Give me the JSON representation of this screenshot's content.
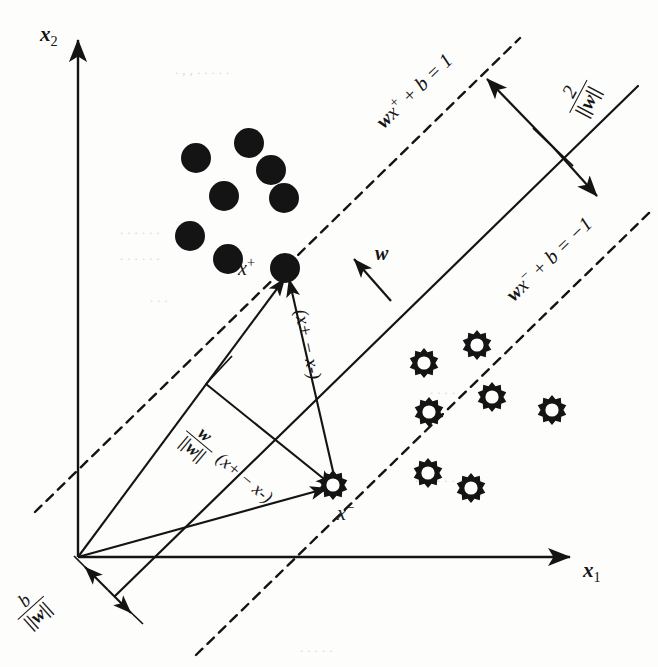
{
  "figure": {
    "axes": {
      "x_label": "x_1",
      "x_label_base": "x",
      "x_label_sub": "1",
      "y_label_base": "x",
      "y_label_sub": "2"
    },
    "labels": {
      "upper_boundary": "wx+ + b = 1",
      "upper_boundary_parts": {
        "w": "w",
        "x": "x",
        "sup": "+",
        "rest": " + b = 1"
      },
      "lower_boundary": "wx- + b = -1",
      "lower_boundary_parts": {
        "w": "w",
        "x": "x",
        "sup": "−",
        "rest": " + b = −1"
      },
      "margin_width_num": "2",
      "margin_width_den": "||w||",
      "normal_vector": "w",
      "support_positive": "x+",
      "support_positive_base": "x",
      "support_positive_sup": "+",
      "support_negative": "x-",
      "support_negative_base": "x",
      "support_negative_sup": "−",
      "bias_num": "b",
      "bias_den": "||w||",
      "difference_vector": "(x+ − x-)",
      "projection_num": "w",
      "projection_den": "||w||",
      "projection_expr": "(x+ − x-)"
    },
    "colors": {
      "ink": "#141414",
      "paper": "#fdfdfc",
      "ghost_text": "#d8d8d4"
    },
    "classes": {
      "positive_name": "positive-class-filled-circle",
      "negative_name": "negative-class-cog-ring"
    }
  },
  "chart_data": {
    "type": "scatter",
    "xlabel": "x_1",
    "ylabel": "x_2",
    "xlim": [
      0,
      658
    ],
    "ylim": [
      667,
      0
    ],
    "grid": false,
    "legend": "none",
    "series": [
      {
        "name": "positive class",
        "marker": "filled-circle",
        "radius": 15,
        "points": [
          [
            196,
            158
          ],
          [
            249,
            143
          ],
          [
            271,
            170
          ],
          [
            224,
            196
          ],
          [
            284,
            198
          ],
          [
            190,
            236
          ],
          [
            228,
            259
          ],
          [
            285,
            268
          ]
        ],
        "support_vector_index": 7
      },
      {
        "name": "negative class",
        "marker": "cog-ring",
        "radius": 15,
        "points": [
          [
            424,
            363
          ],
          [
            477,
            345
          ],
          [
            492,
            397
          ],
          [
            429,
            412
          ],
          [
            552,
            410
          ],
          [
            428,
            473
          ],
          [
            471,
            488
          ],
          [
            333,
            485
          ]
        ],
        "support_vector_index": 7
      }
    ],
    "lines": [
      {
        "name": "upper-margin-boundary",
        "label": "wx+ + b = 1",
        "style": "dashed",
        "from": [
          35,
          512
        ],
        "to": [
          520,
          38
        ]
      },
      {
        "name": "separating-hyperplane",
        "label": "",
        "style": "solid",
        "from": [
          115,
          596
        ],
        "to": [
          638,
          86
        ]
      },
      {
        "name": "lower-margin-boundary",
        "label": "wx- + b = -1",
        "style": "dashed",
        "from": [
          196,
          655
        ],
        "to": [
          652,
          210
        ]
      }
    ],
    "vectors": [
      {
        "name": "x-axis",
        "from": [
          78,
          557
        ],
        "to": [
          575,
          557
        ]
      },
      {
        "name": "y-axis",
        "from": [
          78,
          557
        ],
        "to": [
          78,
          35
        ]
      },
      {
        "name": "origin-to-x-plus",
        "from": [
          78,
          557
        ],
        "to": [
          283,
          274
        ]
      },
      {
        "name": "origin-to-x-minus",
        "from": [
          78,
          557
        ],
        "to": [
          331,
          487
        ]
      },
      {
        "name": "x-minus-to-x-plus",
        "from": [
          333,
          483
        ],
        "to": [
          286,
          275
        ]
      },
      {
        "name": "normal-w",
        "from": [
          391,
          301
        ],
        "to": [
          352,
          257
        ]
      },
      {
        "name": "margin-upper-arrow",
        "from": [
          553,
          147
        ],
        "to": [
          483,
          75
        ]
      },
      {
        "name": "margin-lower-arrow",
        "from": [
          553,
          147
        ],
        "to": [
          601,
          200
        ]
      },
      {
        "name": "projection-guide",
        "from": [
          206,
          384
        ],
        "to": [
          333,
          486
        ]
      },
      {
        "name": "bias-arrow-up",
        "from": [
          105,
          587
        ],
        "to": [
          86,
          568
        ]
      },
      {
        "name": "bias-arrow-down",
        "from": [
          105,
          587
        ],
        "to": [
          128,
          610
        ]
      }
    ]
  },
  "background_ghost_text": [
    {
      "text": "  . ,  , .  .        . . .",
      "x": 175,
      "y": 62,
      "size": 13
    },
    {
      "text": ". .    . .          .  .",
      "x": 120,
      "y": 222,
      "size": 13
    },
    {
      "text": " .  .    .   .   .  .",
      "x": 120,
      "y": 248,
      "size": 13
    },
    {
      "text": "  .  .  .",
      "x": 150,
      "y": 290,
      "size": 13
    },
    {
      "text": "  .    .   .  .",
      "x": 430,
      "y": 382,
      "size": 13
    },
    {
      "text": " .  .  .   . .  .   .",
      "x": 415,
      "y": 470,
      "size": 13
    },
    {
      "text": "  .  .  .    . .",
      "x": 300,
      "y": 640,
      "size": 13
    }
  ]
}
